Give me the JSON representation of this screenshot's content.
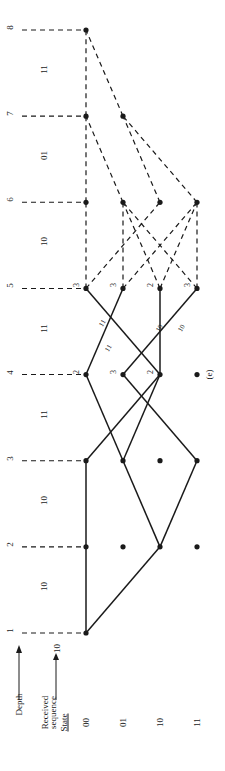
{
  "figure": {
    "label": "(e)",
    "type": "viterbi-trellis",
    "orientation": "rotated-90-ccw"
  },
  "axes": {
    "depth_axis_title": "Depth",
    "received_axis_title_line1": "Received",
    "received_axis_title_line2": "sequence",
    "state_axis_title": "State"
  },
  "depths": [
    {
      "index": 1,
      "label": "1"
    },
    {
      "index": 2,
      "label": "2"
    },
    {
      "index": 3,
      "label": "3"
    },
    {
      "index": 4,
      "label": "4"
    },
    {
      "index": 5,
      "label": "5"
    },
    {
      "index": 6,
      "label": "6"
    },
    {
      "index": 7,
      "label": "7"
    },
    {
      "index": 8,
      "label": "8"
    }
  ],
  "received_sequence": [
    {
      "between": "1-2",
      "bits": "10"
    },
    {
      "between": "2-3",
      "bits": "10"
    },
    {
      "between": "3-4",
      "bits": "11"
    },
    {
      "between": "4-5",
      "bits": "11"
    },
    {
      "between": "5-6",
      "bits": "10"
    },
    {
      "between": "6-7",
      "bits": "01"
    },
    {
      "between": "7-8",
      "bits": "11"
    }
  ],
  "initial_received_marker": "10",
  "states": [
    {
      "id": "00",
      "label": "00"
    },
    {
      "id": "01",
      "label": "01"
    },
    {
      "id": "10",
      "label": "10"
    },
    {
      "id": "11",
      "label": "11"
    }
  ],
  "path_metrics": [
    {
      "depth": 4,
      "state": "00",
      "value": "2"
    },
    {
      "depth": 4,
      "state": "01",
      "value": "3"
    },
    {
      "depth": 4,
      "state": "10",
      "value": "2"
    },
    {
      "depth": 5,
      "state": "00",
      "value": "3"
    },
    {
      "depth": 5,
      "state": "01",
      "value": "3"
    },
    {
      "depth": 5,
      "state": "10",
      "value": "2"
    },
    {
      "depth": 5,
      "state": "11",
      "value": "3"
    }
  ],
  "branch_labels": [
    {
      "from_depth": 4,
      "to_depth": 5,
      "text": "11",
      "slot": 1
    },
    {
      "from_depth": 4,
      "to_depth": 5,
      "text": "11",
      "slot": 2
    },
    {
      "from_depth": 4,
      "to_depth": 5,
      "text": "10",
      "slot": 3
    },
    {
      "from_depth": 4,
      "to_depth": 5,
      "text": "10",
      "slot": 4
    }
  ],
  "nodes": [
    {
      "depth": 1,
      "state": "00",
      "filled": true
    },
    {
      "depth": 2,
      "state": "00",
      "filled": true
    },
    {
      "depth": 2,
      "state": "01",
      "filled": true
    },
    {
      "depth": 2,
      "state": "10",
      "filled": true
    },
    {
      "depth": 2,
      "state": "11",
      "filled": true
    },
    {
      "depth": 3,
      "state": "00",
      "filled": true
    },
    {
      "depth": 3,
      "state": "01",
      "filled": true
    },
    {
      "depth": 3,
      "state": "10",
      "filled": true
    },
    {
      "depth": 3,
      "state": "11",
      "filled": true
    },
    {
      "depth": 4,
      "state": "00",
      "filled": true
    },
    {
      "depth": 4,
      "state": "01",
      "filled": true
    },
    {
      "depth": 4,
      "state": "10",
      "filled": true
    },
    {
      "depth": 4,
      "state": "11",
      "filled": true
    },
    {
      "depth": 5,
      "state": "00",
      "filled": true
    },
    {
      "depth": 5,
      "state": "01",
      "filled": true
    },
    {
      "depth": 5,
      "state": "10",
      "filled": true
    },
    {
      "depth": 5,
      "state": "11",
      "filled": true
    },
    {
      "depth": 6,
      "state": "00",
      "filled": true
    },
    {
      "depth": 6,
      "state": "01",
      "filled": true
    },
    {
      "depth": 6,
      "state": "10",
      "filled": true
    },
    {
      "depth": 6,
      "state": "11",
      "filled": true
    },
    {
      "depth": 7,
      "state": "00",
      "filled": true
    },
    {
      "depth": 7,
      "state": "01",
      "filled": true
    },
    {
      "depth": 8,
      "state": "00",
      "filled": true
    }
  ],
  "survivor_edges": [
    {
      "from": {
        "depth": 1,
        "state": "00"
      },
      "to": {
        "depth": 2,
        "state": "00"
      }
    },
    {
      "from": {
        "depth": 1,
        "state": "00"
      },
      "to": {
        "depth": 2,
        "state": "10"
      }
    },
    {
      "from": {
        "depth": 2,
        "state": "00"
      },
      "to": {
        "depth": 3,
        "state": "00"
      }
    },
    {
      "from": {
        "depth": 2,
        "state": "10"
      },
      "to": {
        "depth": 3,
        "state": "01"
      }
    },
    {
      "from": {
        "depth": 2,
        "state": "10"
      },
      "to": {
        "depth": 3,
        "state": "11"
      }
    },
    {
      "from": {
        "depth": 3,
        "state": "00"
      },
      "to": {
        "depth": 4,
        "state": "10"
      }
    },
    {
      "from": {
        "depth": 3,
        "state": "01"
      },
      "to": {
        "depth": 4,
        "state": "00"
      }
    },
    {
      "from": {
        "depth": 3,
        "state": "11"
      },
      "to": {
        "depth": 4,
        "state": "01"
      }
    },
    {
      "from": {
        "depth": 3,
        "state": "01"
      },
      "to": {
        "depth": 4,
        "state": "10"
      }
    },
    {
      "from": {
        "depth": 4,
        "state": "00"
      },
      "to": {
        "depth": 5,
        "state": "01"
      }
    },
    {
      "from": {
        "depth": 4,
        "state": "01"
      },
      "to": {
        "depth": 5,
        "state": "11"
      }
    },
    {
      "from": {
        "depth": 4,
        "state": "10"
      },
      "to": {
        "depth": 5,
        "state": "00"
      }
    },
    {
      "from": {
        "depth": 4,
        "state": "10"
      },
      "to": {
        "depth": 5,
        "state": "10"
      }
    }
  ],
  "tentative_edges": [
    {
      "from": {
        "depth": 5,
        "state": "00"
      },
      "to": {
        "depth": 6,
        "state": "00"
      }
    },
    {
      "from": {
        "depth": 5,
        "state": "00"
      },
      "to": {
        "depth": 6,
        "state": "10"
      }
    },
    {
      "from": {
        "depth": 5,
        "state": "01"
      },
      "to": {
        "depth": 6,
        "state": "01"
      }
    },
    {
      "from": {
        "depth": 5,
        "state": "01"
      },
      "to": {
        "depth": 6,
        "state": "11"
      }
    },
    {
      "from": {
        "depth": 5,
        "state": "10"
      },
      "to": {
        "depth": 6,
        "state": "01"
      }
    },
    {
      "from": {
        "depth": 5,
        "state": "10"
      },
      "to": {
        "depth": 6,
        "state": "11"
      }
    },
    {
      "from": {
        "depth": 5,
        "state": "11"
      },
      "to": {
        "depth": 6,
        "state": "01"
      }
    },
    {
      "from": {
        "depth": 5,
        "state": "11"
      },
      "to": {
        "depth": 6,
        "state": "11"
      }
    },
    {
      "from": {
        "depth": 6,
        "state": "00"
      },
      "to": {
        "depth": 7,
        "state": "00"
      }
    },
    {
      "from": {
        "depth": 6,
        "state": "01"
      },
      "to": {
        "depth": 7,
        "state": "00"
      }
    },
    {
      "from": {
        "depth": 6,
        "state": "10"
      },
      "to": {
        "depth": 7,
        "state": "01"
      }
    },
    {
      "from": {
        "depth": 6,
        "state": "11"
      },
      "to": {
        "depth": 7,
        "state": "01"
      }
    },
    {
      "from": {
        "depth": 7,
        "state": "00"
      },
      "to": {
        "depth": 8,
        "state": "00"
      }
    },
    {
      "from": {
        "depth": 7,
        "state": "01"
      },
      "to": {
        "depth": 8,
        "state": "00"
      }
    }
  ],
  "colors": {
    "ink": "#1a1a1a",
    "background": "#ffffff"
  }
}
